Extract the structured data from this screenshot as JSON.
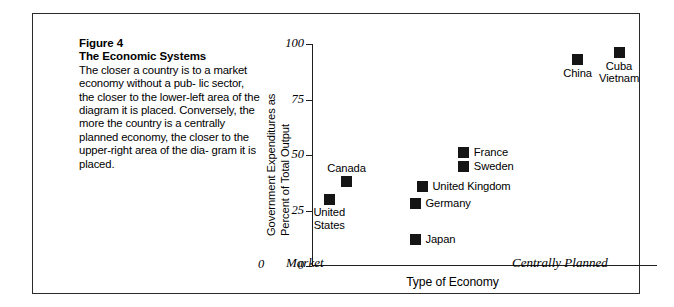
{
  "figure": {
    "title_line1": "Figure 4",
    "title_line2": "The Economic Systems",
    "caption": "The closer a country is to a market economy without a pub-lic sector, the closer to the lower-left area of the diagram it is placed. Conversely, the more the country is a centrally planned economy, the closer to the upper-right area of the dia-gram it is placed.",
    "caption_lines": [
      "The closer a country is to a",
      "market economy without a pub-",
      "lic sector, the closer to the",
      "lower-left area of the diagram it",
      "is placed. Conversely, the more",
      "the country is a centrally",
      "planned economy, the closer to",
      "the upper-right area of the dia-",
      "gram it is placed."
    ]
  },
  "colors": {
    "marker": "#151515",
    "axis": "#1d1d1d",
    "frame": "#2b2b2b",
    "background": "#ffffff"
  },
  "chart_data": {
    "type": "scatter",
    "title": "The Economic Systems",
    "xlabel": "Type of Economy",
    "ylabel": "Government Expenditures as Percent of Total Output",
    "ylabel_line1": "Government Expenditures as",
    "ylabel_line2": "Percent of Total Output",
    "yticks": [
      0,
      25,
      50,
      75,
      100
    ],
    "ytick_labels": [
      "0",
      "25",
      "50",
      "75",
      "100"
    ],
    "ylim": [
      0,
      100
    ],
    "xlim": [
      0,
      100
    ],
    "x_axis_zero_label": "0",
    "x_left_end_label": "Market",
    "x_right_end_label": "Centrally Planned",
    "grid": false,
    "legend": "none",
    "points": [
      {
        "name": "United States",
        "label_lines": [
          "United",
          "States"
        ],
        "x": 5,
        "y": 30,
        "label_pos": "below"
      },
      {
        "name": "Canada",
        "label_lines": [
          "Canada"
        ],
        "x": 10,
        "y": 38,
        "label_pos": "above"
      },
      {
        "name": "Japan",
        "label_lines": [
          "Japan"
        ],
        "x": 30,
        "y": 12,
        "label_pos": "right"
      },
      {
        "name": "Germany",
        "label_lines": [
          "Germany"
        ],
        "x": 30,
        "y": 28,
        "label_pos": "right"
      },
      {
        "name": "United Kingdom",
        "label_lines": [
          "United Kingdom"
        ],
        "x": 32,
        "y": 36,
        "label_pos": "right"
      },
      {
        "name": "Sweden",
        "label_lines": [
          "Sweden"
        ],
        "x": 44,
        "y": 45,
        "label_pos": "right"
      },
      {
        "name": "France",
        "label_lines": [
          "France"
        ],
        "x": 44,
        "y": 51,
        "label_pos": "right"
      },
      {
        "name": "China",
        "label_lines": [
          "China"
        ],
        "x": 77,
        "y": 93,
        "label_pos": "below"
      },
      {
        "name": "Cuba/Vietnam",
        "label_lines": [
          "Cuba",
          "Vietnam"
        ],
        "x": 89,
        "y": 96,
        "label_pos": "below"
      }
    ]
  }
}
